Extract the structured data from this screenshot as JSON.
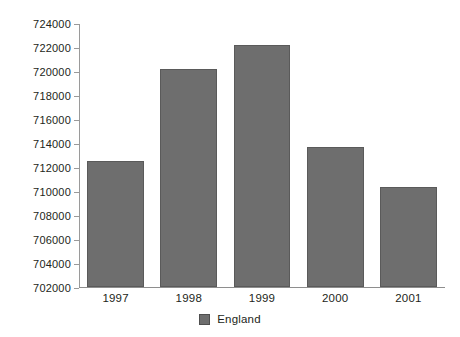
{
  "chart_data": {
    "type": "bar",
    "title": "",
    "xlabel": "",
    "ylabel": "",
    "categories": [
      "1997",
      "1998",
      "1999",
      "2000",
      "2001"
    ],
    "values": [
      712500,
      720200,
      722200,
      713700,
      710300
    ],
    "series": [
      {
        "name": "England",
        "values": [
          712500,
          720200,
          722200,
          713700,
          710300
        ],
        "color": "#6e6e6e"
      }
    ],
    "ylim": [
      702000,
      724000
    ],
    "ytick_step": 2000,
    "ytick_labels": [
      "724000",
      "722000",
      "720000",
      "718000",
      "716000",
      "714000",
      "712000",
      "710000",
      "708000",
      "706000",
      "704000",
      "702000"
    ],
    "grid": false,
    "legend": {
      "position": "bottom-center",
      "entries": [
        {
          "label": "England",
          "color": "#6e6e6e"
        }
      ]
    }
  },
  "legend": {
    "england_label": "England"
  },
  "colors": {
    "bar_fill": "#6e6e6e",
    "bar_border": "#5a5a5a",
    "axis": "#9a9a9a",
    "text": "#231f20",
    "background": "#ffffff"
  }
}
